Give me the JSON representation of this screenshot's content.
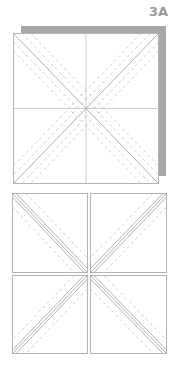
{
  "step": {
    "label": "3A"
  },
  "colors": {
    "line": "#b4b4b4",
    "dash": "#c4c4c4",
    "shadow": "#a8a8a8",
    "label": "#9a9a9a",
    "background": "#ffffff"
  },
  "top_block": {
    "description": "Square block with shadow, center cross lines, solid diagonals flanked by dashed seam lines",
    "square": {
      "x": 13,
      "y": 33,
      "size": 145
    },
    "shadow": {
      "x": 21,
      "y": 26,
      "width": 145,
      "height": 150
    }
  },
  "bottom_block": {
    "description": "Block cut into four quadrants, each showing paired diagonal lines flanked by dashed seam lines",
    "quadrants": [
      {
        "name": "top-left",
        "x": 12,
        "y": 193,
        "w": 75,
        "h": 79
      },
      {
        "name": "top-right",
        "x": 90,
        "y": 193,
        "w": 76,
        "h": 79
      },
      {
        "name": "bottom-left",
        "x": 12,
        "y": 275,
        "w": 75,
        "h": 78
      },
      {
        "name": "bottom-right",
        "x": 90,
        "y": 275,
        "w": 76,
        "h": 78
      }
    ]
  }
}
